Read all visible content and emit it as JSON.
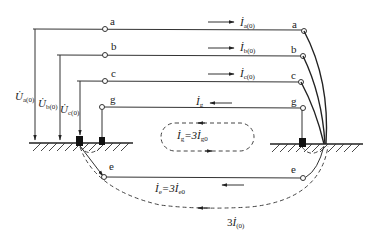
{
  "diagram": {
    "type": "zero-sequence current distribution in grounded system",
    "conductors": [
      {
        "id": "a",
        "label": "a",
        "current_label": "İ",
        "current_sub": "a(0)",
        "voltage_label": "U̇",
        "voltage_sub": "a(0)"
      },
      {
        "id": "b",
        "label": "b",
        "current_label": "İ",
        "current_sub": "b(0)",
        "voltage_label": "U̇",
        "voltage_sub": "b(0)"
      },
      {
        "id": "c",
        "label": "c",
        "current_label": "İ",
        "current_sub": "c(0)",
        "voltage_label": "U̇",
        "voltage_sub": "c(0)"
      },
      {
        "id": "g",
        "label": "g",
        "current_label": "İ",
        "current_sub": "g"
      },
      {
        "id": "e",
        "label": "e"
      }
    ],
    "loop_labels": {
      "ground_wire_loop": {
        "text_main": "İ",
        "sub1": "g",
        "mid": "=3İ",
        "sub2": "g0"
      },
      "earth_return": {
        "text_main": "İ",
        "sub1": "e",
        "mid": "=3İ",
        "sub2": "e0"
      },
      "total": {
        "prefix": "3",
        "text_main": "İ",
        "sub": "(0)"
      }
    },
    "colors": {
      "line": "#333333",
      "ground_block": "#111111",
      "background": "#ffffff"
    }
  }
}
